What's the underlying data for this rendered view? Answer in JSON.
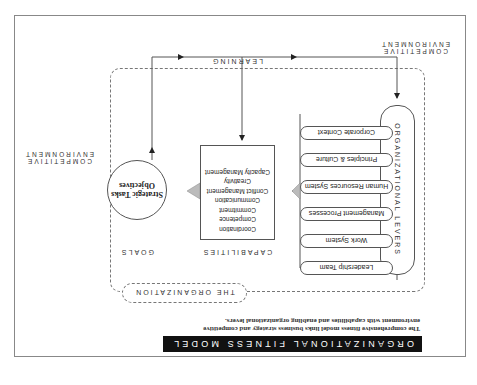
{
  "orientation": "rotated-180",
  "title": "ORGANIZATIONAL FITNESS MODEL",
  "caption": "The comprehensive fitness model links business strategy and competitive environment with capabilities and enabling organizational levers.",
  "environment_label": {
    "line1": "COMPETITIVE",
    "line2": "ENVIRONMENT"
  },
  "organization_label": "THE ORGANIZATION",
  "learning_label": "LEARNING",
  "levers": {
    "heading": "ORGANIZATIONAL LEVERS",
    "items": [
      "Leadership Team",
      "Work System",
      "Management Processes",
      "Human Resources System",
      "Principles & Culture",
      "Corporate Context"
    ]
  },
  "capabilities": {
    "heading": "CAPABILITIES",
    "items": [
      "Coordination",
      "Competence",
      "Commitment",
      "Communication",
      "Conflict Management",
      "Creativity",
      "Capacity Management"
    ]
  },
  "goals": {
    "heading": "GOALS",
    "line1": "Strategic Tasks",
    "line2": "Objectives"
  },
  "colors": {
    "title_bg": "#111111",
    "title_fg": "#ffffff",
    "line": "#555555",
    "dashed": "#777777",
    "arrow_fill": "#bbbbbb"
  }
}
